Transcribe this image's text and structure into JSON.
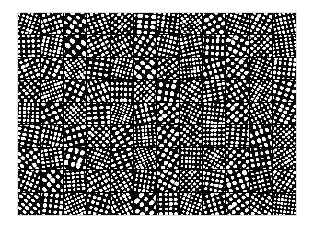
{
  "figure": {
    "kind": "filter-bank-montage",
    "background_color": "#ffffff",
    "panel_color": "#0a0a0a",
    "separator_color": "#000000",
    "blob_color": "#ffffff",
    "canvas": {
      "width": 313,
      "height": 227
    },
    "grid": {
      "left": 18,
      "top": 13,
      "width": 278,
      "height": 202,
      "columns": 12,
      "rows": 9,
      "tile_count": 108,
      "tile_width": 23.2,
      "tile_height": 22.4,
      "separator_width": 1
    },
    "tiles": [
      {
        "index": 0,
        "row": 0,
        "col": 0,
        "orientation_deg": 18,
        "frequency": 5.2,
        "density": 0.62,
        "phase": 0.21
      },
      {
        "index": 1,
        "row": 0,
        "col": 1,
        "orientation_deg": 72,
        "frequency": 4.1,
        "density": 0.58,
        "phase": 0.77
      },
      {
        "index": 2,
        "row": 0,
        "col": 2,
        "orientation_deg": 125,
        "frequency": 3.6,
        "density": 0.55,
        "phase": 1.33
      },
      {
        "index": 3,
        "row": 0,
        "col": 3,
        "orientation_deg": 160,
        "frequency": 4.6,
        "density": 0.6,
        "phase": 2.04
      },
      {
        "index": 4,
        "row": 0,
        "col": 4,
        "orientation_deg": 40,
        "frequency": 5.0,
        "density": 0.57,
        "phase": 0.48
      },
      {
        "index": 5,
        "row": 0,
        "col": 5,
        "orientation_deg": 95,
        "frequency": 3.9,
        "density": 0.63,
        "phase": 2.61
      },
      {
        "index": 6,
        "row": 0,
        "col": 6,
        "orientation_deg": 8,
        "frequency": 4.4,
        "density": 0.56,
        "phase": 1.12
      },
      {
        "index": 7,
        "row": 0,
        "col": 7,
        "orientation_deg": 143,
        "frequency": 5.4,
        "density": 0.61,
        "phase": 0.05
      },
      {
        "index": 8,
        "row": 0,
        "col": 8,
        "orientation_deg": 58,
        "frequency": 3.4,
        "density": 0.59,
        "phase": 1.88
      },
      {
        "index": 9,
        "row": 0,
        "col": 9,
        "orientation_deg": 110,
        "frequency": 4.8,
        "density": 0.54,
        "phase": 2.33
      },
      {
        "index": 10,
        "row": 0,
        "col": 10,
        "orientation_deg": 28,
        "frequency": 4.0,
        "density": 0.6,
        "phase": 0.92
      },
      {
        "index": 11,
        "row": 0,
        "col": 11,
        "orientation_deg": 168,
        "frequency": 5.6,
        "density": 0.58,
        "phase": 1.57
      },
      {
        "index": 12,
        "row": 1,
        "col": 0,
        "orientation_deg": 88,
        "frequency": 4.3,
        "density": 0.57,
        "phase": 0.33
      },
      {
        "index": 13,
        "row": 1,
        "col": 1,
        "orientation_deg": 12,
        "frequency": 5.1,
        "density": 0.64,
        "phase": 2.11
      },
      {
        "index": 14,
        "row": 1,
        "col": 2,
        "orientation_deg": 135,
        "frequency": 3.2,
        "density": 0.5,
        "phase": 1.45
      },
      {
        "index": 15,
        "row": 1,
        "col": 3,
        "orientation_deg": 62,
        "frequency": 4.7,
        "density": 0.61,
        "phase": 0.68
      },
      {
        "index": 16,
        "row": 1,
        "col": 4,
        "orientation_deg": 151,
        "frequency": 5.3,
        "density": 0.59,
        "phase": 2.75
      },
      {
        "index": 17,
        "row": 1,
        "col": 5,
        "orientation_deg": 33,
        "frequency": 3.8,
        "density": 0.55,
        "phase": 1.02
      },
      {
        "index": 18,
        "row": 1,
        "col": 6,
        "orientation_deg": 104,
        "frequency": 4.5,
        "density": 0.62,
        "phase": 0.14
      },
      {
        "index": 19,
        "row": 1,
        "col": 7,
        "orientation_deg": 77,
        "frequency": 5.5,
        "density": 0.58,
        "phase": 1.96
      },
      {
        "index": 20,
        "row": 1,
        "col": 8,
        "orientation_deg": 3,
        "frequency": 4.2,
        "density": 0.56,
        "phase": 2.47
      },
      {
        "index": 21,
        "row": 1,
        "col": 9,
        "orientation_deg": 119,
        "frequency": 3.5,
        "density": 0.63,
        "phase": 0.81
      },
      {
        "index": 22,
        "row": 1,
        "col": 10,
        "orientation_deg": 47,
        "frequency": 4.9,
        "density": 0.6,
        "phase": 1.29
      },
      {
        "index": 23,
        "row": 1,
        "col": 11,
        "orientation_deg": 172,
        "frequency": 5.0,
        "density": 0.54,
        "phase": 2.18
      },
      {
        "index": 24,
        "row": 2,
        "col": 0,
        "orientation_deg": 67,
        "frequency": 4.6,
        "density": 0.61,
        "phase": 0.44
      },
      {
        "index": 25,
        "row": 2,
        "col": 1,
        "orientation_deg": 22,
        "frequency": 3.7,
        "density": 0.57,
        "phase": 1.71
      },
      {
        "index": 26,
        "row": 2,
        "col": 2,
        "orientation_deg": 146,
        "frequency": 5.2,
        "density": 0.65,
        "phase": 2.55
      },
      {
        "index": 27,
        "row": 2,
        "col": 3,
        "orientation_deg": 99,
        "frequency": 4.0,
        "density": 0.52,
        "phase": 0.09
      },
      {
        "index": 28,
        "row": 2,
        "col": 4,
        "orientation_deg": 15,
        "frequency": 5.7,
        "density": 0.59,
        "phase": 1.18
      },
      {
        "index": 29,
        "row": 2,
        "col": 5,
        "orientation_deg": 130,
        "frequency": 3.3,
        "density": 0.63,
        "phase": 2.86
      },
      {
        "index": 30,
        "row": 2,
        "col": 6,
        "orientation_deg": 54,
        "frequency": 4.4,
        "density": 0.56,
        "phase": 0.57
      },
      {
        "index": 31,
        "row": 2,
        "col": 7,
        "orientation_deg": 83,
        "frequency": 5.1,
        "density": 0.6,
        "phase": 1.83
      },
      {
        "index": 32,
        "row": 2,
        "col": 8,
        "orientation_deg": 164,
        "frequency": 4.1,
        "density": 0.58,
        "phase": 0.26
      },
      {
        "index": 33,
        "row": 2,
        "col": 9,
        "orientation_deg": 37,
        "frequency": 3.9,
        "density": 0.62,
        "phase": 2.29
      },
      {
        "index": 34,
        "row": 2,
        "col": 10,
        "orientation_deg": 114,
        "frequency": 5.4,
        "density": 0.55,
        "phase": 1.05
      },
      {
        "index": 35,
        "row": 2,
        "col": 11,
        "orientation_deg": 6,
        "frequency": 4.7,
        "density": 0.61,
        "phase": 0.73
      },
      {
        "index": 36,
        "row": 3,
        "col": 0,
        "orientation_deg": 141,
        "frequency": 4.2,
        "density": 0.57,
        "phase": 1.62
      },
      {
        "index": 37,
        "row": 3,
        "col": 1,
        "orientation_deg": 70,
        "frequency": 5.5,
        "density": 0.64,
        "phase": 2.41
      },
      {
        "index": 38,
        "row": 3,
        "col": 2,
        "orientation_deg": 25,
        "frequency": 3.6,
        "density": 0.53,
        "phase": 0.18
      },
      {
        "index": 39,
        "row": 3,
        "col": 3,
        "orientation_deg": 157,
        "frequency": 4.8,
        "density": 0.6,
        "phase": 1.37
      },
      {
        "index": 40,
        "row": 3,
        "col": 4,
        "orientation_deg": 91,
        "frequency": 4.0,
        "density": 0.58,
        "phase": 2.68
      },
      {
        "index": 41,
        "row": 3,
        "col": 5,
        "orientation_deg": 44,
        "frequency": 5.3,
        "density": 0.62,
        "phase": 0.86
      },
      {
        "index": 42,
        "row": 3,
        "col": 6,
        "orientation_deg": 10,
        "frequency": 3.4,
        "density": 0.55,
        "phase": 1.94
      },
      {
        "index": 43,
        "row": 3,
        "col": 7,
        "orientation_deg": 122,
        "frequency": 4.5,
        "density": 0.61,
        "phase": 0.39
      },
      {
        "index": 44,
        "row": 3,
        "col": 8,
        "orientation_deg": 79,
        "frequency": 5.0,
        "density": 0.59,
        "phase": 2.23
      },
      {
        "index": 45,
        "row": 3,
        "col": 9,
        "orientation_deg": 148,
        "frequency": 4.3,
        "density": 0.54,
        "phase": 1.11
      },
      {
        "index": 46,
        "row": 3,
        "col": 10,
        "orientation_deg": 31,
        "frequency": 5.6,
        "density": 0.63,
        "phase": 0.62
      },
      {
        "index": 47,
        "row": 3,
        "col": 11,
        "orientation_deg": 107,
        "frequency": 3.8,
        "density": 0.57,
        "phase": 2.79
      },
      {
        "index": 48,
        "row": 4,
        "col": 0,
        "orientation_deg": 2,
        "frequency": 4.9,
        "density": 0.6,
        "phase": 1.24
      },
      {
        "index": 49,
        "row": 4,
        "col": 1,
        "orientation_deg": 64,
        "frequency": 3.5,
        "density": 0.56,
        "phase": 0.5
      },
      {
        "index": 50,
        "row": 4,
        "col": 2,
        "orientation_deg": 138,
        "frequency": 5.2,
        "density": 0.65,
        "phase": 2.08
      },
      {
        "index": 51,
        "row": 4,
        "col": 3,
        "orientation_deg": 86,
        "frequency": 4.1,
        "density": 0.52,
        "phase": 1.5
      },
      {
        "index": 52,
        "row": 4,
        "col": 4,
        "orientation_deg": 19,
        "frequency": 5.8,
        "density": 0.61,
        "phase": 0.02
      },
      {
        "index": 53,
        "row": 4,
        "col": 5,
        "orientation_deg": 166,
        "frequency": 4.4,
        "density": 0.58,
        "phase": 2.92
      },
      {
        "index": 54,
        "row": 4,
        "col": 6,
        "orientation_deg": 51,
        "frequency": 3.7,
        "density": 0.63,
        "phase": 0.95
      },
      {
        "index": 55,
        "row": 4,
        "col": 7,
        "orientation_deg": 116,
        "frequency": 5.1,
        "density": 0.55,
        "phase": 1.78
      },
      {
        "index": 56,
        "row": 4,
        "col": 8,
        "orientation_deg": 96,
        "frequency": 4.6,
        "density": 0.59,
        "phase": 0.3
      },
      {
        "index": 57,
        "row": 4,
        "col": 9,
        "orientation_deg": 42,
        "frequency": 4.0,
        "density": 0.62,
        "phase": 2.36
      },
      {
        "index": 58,
        "row": 4,
        "col": 10,
        "orientation_deg": 153,
        "frequency": 5.4,
        "density": 0.57,
        "phase": 1.16
      },
      {
        "index": 59,
        "row": 4,
        "col": 11,
        "orientation_deg": 26,
        "frequency": 3.9,
        "density": 0.6,
        "phase": 0.69
      },
      {
        "index": 60,
        "row": 5,
        "col": 0,
        "orientation_deg": 102,
        "frequency": 4.7,
        "density": 0.58,
        "phase": 1.41
      },
      {
        "index": 61,
        "row": 5,
        "col": 1,
        "orientation_deg": 13,
        "frequency": 5.3,
        "density": 0.64,
        "phase": 2.6
      },
      {
        "index": 62,
        "row": 5,
        "col": 2,
        "orientation_deg": 74,
        "frequency": 3.3,
        "density": 0.51,
        "phase": 0.23
      },
      {
        "index": 63,
        "row": 5,
        "col": 3,
        "orientation_deg": 133,
        "frequency": 4.8,
        "density": 0.61,
        "phase": 1.87
      },
      {
        "index": 64,
        "row": 5,
        "col": 4,
        "orientation_deg": 59,
        "frequency": 4.2,
        "density": 0.56,
        "phase": 0.78
      },
      {
        "index": 65,
        "row": 5,
        "col": 5,
        "orientation_deg": 175,
        "frequency": 5.5,
        "density": 0.62,
        "phase": 2.15
      },
      {
        "index": 66,
        "row": 5,
        "col": 6,
        "orientation_deg": 35,
        "frequency": 3.6,
        "density": 0.59,
        "phase": 0.11
      },
      {
        "index": 67,
        "row": 5,
        "col": 7,
        "orientation_deg": 127,
        "frequency": 4.5,
        "density": 0.54,
        "phase": 1.68
      },
      {
        "index": 68,
        "row": 5,
        "col": 8,
        "orientation_deg": 90,
        "frequency": 5.0,
        "density": 0.63,
        "phase": 2.5
      },
      {
        "index": 69,
        "row": 5,
        "col": 9,
        "orientation_deg": 5,
        "frequency": 4.3,
        "density": 0.57,
        "phase": 0.41
      },
      {
        "index": 70,
        "row": 5,
        "col": 10,
        "orientation_deg": 161,
        "frequency": 3.8,
        "density": 0.6,
        "phase": 1.99
      },
      {
        "index": 71,
        "row": 5,
        "col": 11,
        "orientation_deg": 49,
        "frequency": 5.7,
        "density": 0.58,
        "phase": 1.07
      },
      {
        "index": 72,
        "row": 6,
        "col": 0,
        "orientation_deg": 144,
        "frequency": 4.1,
        "density": 0.61,
        "phase": 0.55
      },
      {
        "index": 73,
        "row": 6,
        "col": 1,
        "orientation_deg": 81,
        "frequency": 5.2,
        "density": 0.56,
        "phase": 2.27
      },
      {
        "index": 74,
        "row": 6,
        "col": 2,
        "orientation_deg": 16,
        "frequency": 3.4,
        "density": 0.64,
        "phase": 1.34
      },
      {
        "index": 75,
        "row": 6,
        "col": 3,
        "orientation_deg": 112,
        "frequency": 4.9,
        "density": 0.59,
        "phase": 0.07
      },
      {
        "index": 76,
        "row": 6,
        "col": 4,
        "orientation_deg": 68,
        "frequency": 4.4,
        "density": 0.53,
        "phase": 2.72
      },
      {
        "index": 77,
        "row": 6,
        "col": 5,
        "orientation_deg": 156,
        "frequency": 5.6,
        "density": 0.62,
        "phase": 1.21
      },
      {
        "index": 78,
        "row": 6,
        "col": 6,
        "orientation_deg": 29,
        "frequency": 3.7,
        "density": 0.57,
        "phase": 0.88
      },
      {
        "index": 79,
        "row": 6,
        "col": 7,
        "orientation_deg": 93,
        "frequency": 4.6,
        "density": 0.6,
        "phase": 1.9
      },
      {
        "index": 80,
        "row": 6,
        "col": 8,
        "orientation_deg": 121,
        "frequency": 5.1,
        "density": 0.65,
        "phase": 0.36
      },
      {
        "index": 81,
        "row": 6,
        "col": 9,
        "orientation_deg": 40,
        "frequency": 4.0,
        "density": 0.55,
        "phase": 2.44
      },
      {
        "index": 82,
        "row": 6,
        "col": 10,
        "orientation_deg": 170,
        "frequency": 3.9,
        "density": 0.48,
        "phase": 1.55
      },
      {
        "index": 83,
        "row": 6,
        "col": 11,
        "orientation_deg": 56,
        "frequency": 5.3,
        "density": 0.61,
        "phase": 0.64
      },
      {
        "index": 84,
        "row": 7,
        "col": 0,
        "orientation_deg": 23,
        "frequency": 4.8,
        "density": 0.59,
        "phase": 2.03
      },
      {
        "index": 85,
        "row": 7,
        "col": 1,
        "orientation_deg": 137,
        "frequency": 3.5,
        "density": 0.63,
        "phase": 1.15
      },
      {
        "index": 86,
        "row": 7,
        "col": 2,
        "orientation_deg": 85,
        "frequency": 5.4,
        "density": 0.56,
        "phase": 0.28
      },
      {
        "index": 87,
        "row": 7,
        "col": 3,
        "orientation_deg": 61,
        "frequency": 4.2,
        "density": 0.62,
        "phase": 2.57
      },
      {
        "index": 88,
        "row": 7,
        "col": 4,
        "orientation_deg": 149,
        "frequency": 4.7,
        "density": 0.58,
        "phase": 1.46
      },
      {
        "index": 89,
        "row": 7,
        "col": 5,
        "orientation_deg": 9,
        "frequency": 5.0,
        "density": 0.54,
        "phase": 0.83
      },
      {
        "index": 90,
        "row": 7,
        "col": 6,
        "orientation_deg": 118,
        "frequency": 3.8,
        "density": 0.61,
        "phase": 2.31
      },
      {
        "index": 91,
        "row": 7,
        "col": 7,
        "orientation_deg": 46,
        "frequency": 5.5,
        "density": 0.57,
        "phase": 0.16
      },
      {
        "index": 92,
        "row": 7,
        "col": 8,
        "orientation_deg": 100,
        "frequency": 4.3,
        "density": 0.6,
        "phase": 1.74
      },
      {
        "index": 93,
        "row": 7,
        "col": 9,
        "orientation_deg": 159,
        "frequency": 3.6,
        "density": 0.64,
        "phase": 2.84
      },
      {
        "index": 94,
        "row": 7,
        "col": 10,
        "orientation_deg": 76,
        "frequency": 4.9,
        "density": 0.55,
        "phase": 0.47
      },
      {
        "index": 95,
        "row": 7,
        "col": 11,
        "orientation_deg": 32,
        "frequency": 5.2,
        "density": 0.59,
        "phase": 1.28
      },
      {
        "index": 96,
        "row": 8,
        "col": 0,
        "orientation_deg": 129,
        "frequency": 4.5,
        "density": 0.62,
        "phase": 0.71
      },
      {
        "index": 97,
        "row": 8,
        "col": 1,
        "orientation_deg": 7,
        "frequency": 3.9,
        "density": 0.57,
        "phase": 2.19
      },
      {
        "index": 98,
        "row": 8,
        "col": 2,
        "orientation_deg": 66,
        "frequency": 5.6,
        "density": 0.6,
        "phase": 1.09
      },
      {
        "index": 99,
        "row": 8,
        "col": 3,
        "orientation_deg": 108,
        "frequency": 4.1,
        "density": 0.53,
        "phase": 0.34
      },
      {
        "index": 100,
        "row": 8,
        "col": 4,
        "orientation_deg": 152,
        "frequency": 5.1,
        "density": 0.63,
        "phase": 1.81
      },
      {
        "index": 101,
        "row": 8,
        "col": 5,
        "orientation_deg": 38,
        "frequency": 3.4,
        "density": 0.58,
        "phase": 2.66
      },
      {
        "index": 102,
        "row": 8,
        "col": 6,
        "orientation_deg": 89,
        "frequency": 4.6,
        "density": 0.56,
        "phase": 0.52
      },
      {
        "index": 103,
        "row": 8,
        "col": 7,
        "orientation_deg": 20,
        "frequency": 5.3,
        "density": 0.61,
        "phase": 1.93
      },
      {
        "index": 104,
        "row": 8,
        "col": 8,
        "orientation_deg": 163,
        "frequency": 4.0,
        "density": 0.59,
        "phase": 0.2
      },
      {
        "index": 105,
        "row": 8,
        "col": 9,
        "orientation_deg": 53,
        "frequency": 3.7,
        "density": 0.64,
        "phase": 2.4
      },
      {
        "index": 106,
        "row": 8,
        "col": 10,
        "orientation_deg": 124,
        "frequency": 4.8,
        "density": 0.55,
        "phase": 1.36
      },
      {
        "index": 107,
        "row": 8,
        "col": 11,
        "orientation_deg": 97,
        "frequency": 5.7,
        "density": 0.6,
        "phase": 0.99
      }
    ]
  }
}
